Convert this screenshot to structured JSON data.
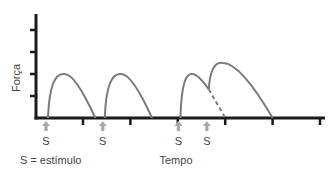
{
  "chart_data": {
    "type": "line",
    "title": "",
    "ylabel": "Força",
    "xlabel": "Tempo",
    "legend_note": "S = estímulo",
    "legend_placement": "bottom-left",
    "grid": false,
    "xlim": [
      0,
      6
    ],
    "ylim": [
      0,
      5
    ],
    "x_tick_count": 6,
    "y_tick_count": 4,
    "series": [
      {
        "name": "twitch-1",
        "style": "solid",
        "points": [
          [
            0,
            0
          ],
          [
            0.35,
            2.0
          ],
          [
            1.0,
            0
          ]
        ]
      },
      {
        "name": "twitch-2",
        "style": "solid",
        "points": [
          [
            1.2,
            0
          ],
          [
            1.55,
            2.0
          ],
          [
            2.2,
            0
          ]
        ]
      },
      {
        "name": "summation-first-rise",
        "style": "solid",
        "points": [
          [
            2.8,
            0
          ],
          [
            3.05,
            2.0
          ],
          [
            3.4,
            1.3
          ]
        ]
      },
      {
        "name": "summation-second-twitch",
        "style": "solid",
        "points": [
          [
            3.4,
            1.3
          ],
          [
            3.7,
            2.5
          ],
          [
            4.75,
            0
          ]
        ]
      },
      {
        "name": "unsummed-decay",
        "style": "dashed",
        "points": [
          [
            3.4,
            1.3
          ],
          [
            3.75,
            0
          ]
        ]
      }
    ],
    "stimuli": [
      {
        "label": "S",
        "x": 0
      },
      {
        "label": "S",
        "x": 1.2
      },
      {
        "label": "S",
        "x": 2.8
      },
      {
        "label": "S",
        "x": 3.4
      }
    ]
  },
  "colors": {
    "axis": "#1a1a1a",
    "curve": "#7a7a7a",
    "arrow": "#a8a8a8",
    "text": "#444444"
  }
}
